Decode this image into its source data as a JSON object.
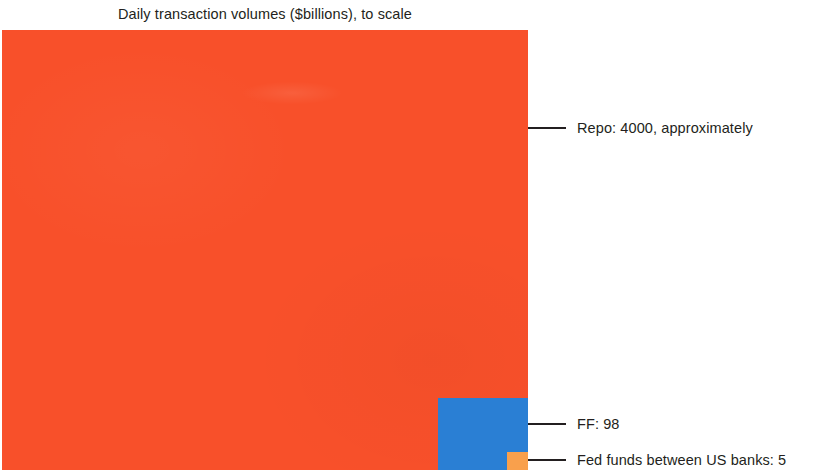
{
  "chart_data": {
    "type": "area",
    "title": "Daily transaction volumes ($billions), to scale",
    "subtitle": "",
    "xlabel": "",
    "ylabel": "",
    "units": "$billions",
    "scaling": "area-proportional nested squares",
    "categories": [
      "Repo",
      "FF",
      "Fed funds between US banks"
    ],
    "values": [
      4000,
      98,
      5
    ],
    "series": [
      {
        "name": "Daily transaction volume",
        "values": [
          4000,
          98,
          5
        ]
      }
    ],
    "annotations": [
      "Repo: 4000, approximately",
      "FF: 98",
      "Fed funds between US banks: 5"
    ],
    "legend_position": "right-callouts",
    "grid": false,
    "colors": {
      "repo": "#f8502a",
      "ff": "#2a7fd4",
      "fed_funds": "#f9a04c",
      "text": "#231f20",
      "background": "#ffffff"
    }
  },
  "title": "Daily transaction volumes ($billions), to scale",
  "squares": {
    "repo": {
      "label": "Repo",
      "value": 4000,
      "color": "#f8502a"
    },
    "ff": {
      "label": "FF",
      "value": 98,
      "color": "#2a7fd4"
    },
    "fed_funds": {
      "label": "Fed funds between US banks",
      "value": 5,
      "color": "#f9a04c"
    }
  },
  "callouts": {
    "repo": "Repo: 4000, approximately",
    "ff": "FF: 98",
    "fed_funds": "Fed funds between US banks: 5"
  }
}
